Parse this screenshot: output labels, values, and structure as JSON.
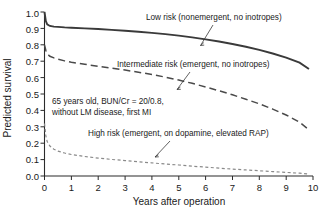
{
  "chart_data": {
    "type": "line",
    "title": "",
    "xlabel": "Years after operation",
    "ylabel": "Predicted survival",
    "xlim": [
      0,
      10
    ],
    "ylim": [
      0.0,
      1.0
    ],
    "grid": false,
    "legend_position": "inline-annotations",
    "xticks": [
      "0",
      "1",
      "2",
      "3",
      "4",
      "5",
      "6",
      "7",
      "8",
      "9",
      "10"
    ],
    "yticks": [
      "0.0",
      "0.1",
      "0.2",
      "0.3",
      "0.4",
      "0.5",
      "0.6",
      "0.7",
      "0.8",
      "0.9",
      "1.0"
    ],
    "x": [
      0,
      0.05,
      0.1,
      0.2,
      0.35,
      0.5,
      0.75,
      1,
      1.5,
      2,
      2.5,
      3,
      3.5,
      4,
      4.5,
      5,
      5.5,
      6,
      6.5,
      7,
      7.5,
      8,
      8.5,
      9,
      9.5,
      9.85
    ],
    "series": [
      {
        "name": "Low risk (nonemergent, no inotropes)",
        "style": "solid",
        "color": "#3a3a3a",
        "values": [
          1.0,
          0.945,
          0.925,
          0.915,
          0.911,
          0.909,
          0.906,
          0.904,
          0.9,
          0.896,
          0.891,
          0.886,
          0.88,
          0.873,
          0.865,
          0.856,
          0.845,
          0.833,
          0.82,
          0.805,
          0.788,
          0.769,
          0.747,
          0.722,
          0.691,
          0.652
        ]
      },
      {
        "name": "Intermediate risk (emergent, no inotropes)",
        "style": "dashed",
        "color": "#4a4a4a",
        "values": [
          0.8,
          0.765,
          0.745,
          0.73,
          0.72,
          0.712,
          0.702,
          0.694,
          0.681,
          0.669,
          0.658,
          0.646,
          0.633,
          0.619,
          0.603,
          0.585,
          0.565,
          0.543,
          0.52,
          0.495,
          0.468,
          0.44,
          0.408,
          0.372,
          0.328,
          0.282
        ]
      },
      {
        "name": "High risk (emergent, on dopamine, elevated RAP)",
        "style": "dotted",
        "color": "#8a8a8a",
        "values": [
          0.32,
          0.245,
          0.21,
          0.183,
          0.163,
          0.152,
          0.14,
          0.131,
          0.119,
          0.109,
          0.101,
          0.094,
          0.087,
          0.08,
          0.073,
          0.067,
          0.06,
          0.054,
          0.048,
          0.042,
          0.037,
          0.032,
          0.027,
          0.022,
          0.017,
          0.012
        ]
      }
    ],
    "annotations": [
      {
        "id": "low-risk",
        "text": "Low risk (nonemergent, no inotropes)",
        "target_x": 5.9,
        "target_y": 0.836
      },
      {
        "id": "intermediate-risk",
        "text": "Intermediate risk (emergent, no inotropes)",
        "target_x": 5.05,
        "target_y": 0.517
      },
      {
        "id": "patient-profile-line1",
        "text": "65 years old, BUN/Cr = 20/0.8,"
      },
      {
        "id": "patient-profile-line2",
        "text": "without LM disease, first MI"
      },
      {
        "id": "high-risk",
        "text": "High risk (emergent, on dopamine, elevated RAP)",
        "target_x": 4.25,
        "target_y": 0.072
      }
    ]
  }
}
